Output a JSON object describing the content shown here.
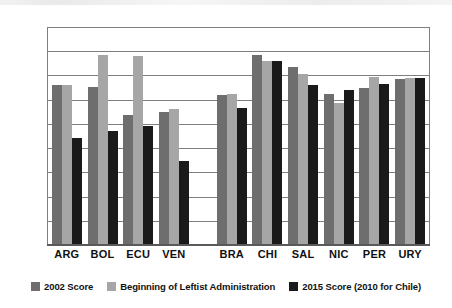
{
  "chart_data": {
    "type": "bar",
    "title": "",
    "subtitle": "",
    "xlabel": "",
    "ylabel": "",
    "ylim": [
      0.0,
      90.0
    ],
    "yticks": [
      "0.0",
      "10.0",
      "20.0",
      "30.0",
      "40.0",
      "50.0",
      "60.0",
      "70.0",
      "80.0",
      "90.0"
    ],
    "grid": true,
    "legend_position": "bottom",
    "categories": [
      "ARG",
      "BOL",
      "ECU",
      "VEN",
      "BRA",
      "CHI",
      "SAL",
      "NIC",
      "PER",
      "URY"
    ],
    "group_break_after": "VEN",
    "series": [
      {
        "name": "2002 Score",
        "color": "#6e6e6e",
        "values": [
          66.0,
          65.3,
          53.5,
          55.0,
          62.0,
          78.5,
          73.3,
          62.5,
          65.0,
          68.5
        ]
      },
      {
        "name": "Beginning of Leftist Administration",
        "color": "#a6a6a6",
        "values": [
          66.0,
          78.5,
          78.0,
          56.3,
          62.2,
          76.0,
          70.5,
          58.8,
          69.5,
          68.8
        ]
      },
      {
        "name": "2015 Score (2010 for Chile)",
        "color": "#1a1a1a",
        "values": [
          44.0,
          47.0,
          49.2,
          34.5,
          56.7,
          76.0,
          66.0,
          64.0,
          66.5,
          69.0
        ]
      }
    ]
  },
  "legend": {
    "items": [
      {
        "label": "2002 Score",
        "swatch": "series-0-swatch"
      },
      {
        "label": "Beginning of Leftist Administration",
        "swatch": "series-1-swatch"
      },
      {
        "label": "2015 Score (2010 for Chile)",
        "swatch": "series-2-swatch"
      }
    ]
  },
  "colors": {
    "series_2002": "#6e6e6e",
    "series_beginning": "#a6a6a6",
    "series_2015": "#1a1a1a",
    "grid": "#7f7f7f",
    "text": "#111111"
  }
}
